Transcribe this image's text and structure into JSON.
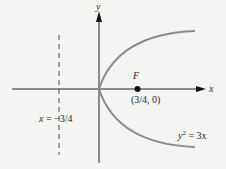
{
  "diagram": {
    "axes": {
      "x_label": "x",
      "y_label": "y"
    },
    "focus": {
      "label": "F",
      "coords_label": "(3/4, 0)",
      "x": 0.75,
      "y": 0
    },
    "directrix": {
      "label_lhs": "x",
      "label_eq": "=",
      "label_rhs": "−3/4",
      "x": -0.75
    },
    "curve": {
      "label_y": "y",
      "label_exp": "2",
      "label_rest": "= 3x",
      "equation": "y^2 = 3x"
    },
    "colors": {
      "background": "#f4f4f2",
      "axis": "#222222",
      "curve": "#8a8a8a",
      "text": "#2a2a2a"
    }
  }
}
